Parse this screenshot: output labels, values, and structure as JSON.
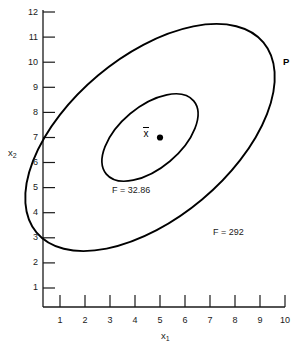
{
  "chart_data": {
    "type": "line",
    "title": "",
    "subtitle": "",
    "xlabel": "x₁",
    "ylabel": "x₂",
    "xlim": [
      0.4,
      10.6
    ],
    "ylim": [
      0.5,
      12.4
    ],
    "grid": false,
    "legend_position": "none",
    "x_ticks": [
      "1",
      "2",
      "3",
      "4",
      "5",
      "6",
      "7",
      "8",
      "9",
      "10"
    ],
    "x_tick_values": [
      1,
      2,
      3,
      4,
      5,
      6,
      7,
      8,
      9,
      10
    ],
    "y_ticks": [
      "1",
      "2",
      "3",
      "4",
      "5",
      "6",
      "7",
      "8",
      "9",
      "10",
      "11",
      "12"
    ],
    "y_tick_values": [
      1,
      2,
      3,
      4,
      5,
      6,
      7,
      8,
      9,
      10,
      11,
      12
    ],
    "series": [
      {
        "name": "F = 292",
        "type": "ellipse-contour",
        "label": "F = 292",
        "level": 292,
        "center": [
          5.0,
          7.0
        ],
        "semi_major": 5.95,
        "semi_minor": 3.25,
        "rotation_deg": -40,
        "color": "#000000"
      },
      {
        "name": "F = 32.86",
        "type": "ellipse-contour",
        "label": "F = 32.86",
        "level": 32.86,
        "center": [
          5.0,
          7.0
        ],
        "semi_major": 2.3,
        "semi_minor": 1.25,
        "rotation_deg": -40,
        "color": "#000000"
      }
    ],
    "points": [
      {
        "name": "mean-point",
        "label": "x̄",
        "x": 5.4,
        "y": 7.0,
        "marker": "filled-circle",
        "color": "#000000"
      },
      {
        "name": "point-P",
        "label": "P",
        "x": 9.9,
        "y": 9.75,
        "marker": "none",
        "color": "#000000"
      }
    ],
    "annotations": [
      {
        "name": "inner-contour-annotation",
        "text": "F = 32.86",
        "x": 3.6,
        "y": 4.6
      },
      {
        "name": "outer-contour-annotation",
        "text": "F = 292",
        "x": 8.6,
        "y": 2.9
      },
      {
        "name": "point-p-annotation",
        "text": "P",
        "x": 10.2,
        "y": 9.8
      },
      {
        "name": "mean-annotation",
        "text": "x̄",
        "x": 5.0,
        "y": 7.0
      }
    ]
  }
}
